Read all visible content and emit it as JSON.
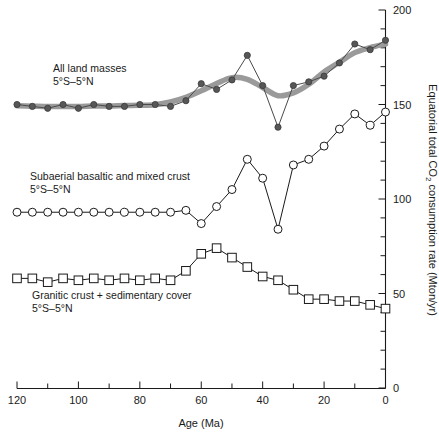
{
  "chart_data": {
    "type": "line",
    "title": "",
    "xlabel": "Age (Ma)",
    "ylabel": "Equatorial total CO2 consumption rate (Mton/yr)",
    "ylabel_parts": {
      "pre": "Equatorial total CO",
      "sub": "2",
      "post": " consumption rate (Mton/yr)"
    },
    "xlim": [
      120,
      0
    ],
    "ylim": [
      0,
      200
    ],
    "x_reversed": true,
    "grid": false,
    "legend_position": "inline-annotations",
    "x_ticks_major": [
      120,
      100,
      80,
      60,
      40,
      20,
      0
    ],
    "x_ticks_minor": [
      110,
      90,
      70,
      50,
      30,
      10
    ],
    "y_ticks_major": [
      0,
      50,
      100,
      150,
      200
    ],
    "y_ticks_minor": [
      10,
      20,
      30,
      40,
      60,
      70,
      80,
      90,
      110,
      120,
      130,
      140,
      160,
      170,
      180,
      190
    ],
    "x_tick_labels": [
      "120",
      "100",
      "80",
      "60",
      "40",
      "20",
      "0"
    ],
    "y_tick_labels": [
      "0",
      "50",
      "100",
      "150",
      "200"
    ],
    "series": [
      {
        "name": "All land masses 5°S–5°N",
        "marker": "filled-circle",
        "color": "#575757",
        "has_smoothed_overlay": true,
        "smoothed_color": "#9a9a9a",
        "x": [
          120,
          115,
          110,
          105,
          100,
          95,
          90,
          85,
          80,
          75,
          70,
          65,
          60,
          55,
          50,
          45,
          40,
          35,
          30,
          25,
          20,
          15,
          10,
          5,
          0
        ],
        "y": [
          150,
          149,
          148,
          150,
          148,
          150,
          149,
          149,
          150,
          150,
          149,
          152,
          161,
          158,
          163,
          176,
          160,
          138,
          160,
          162,
          165,
          172,
          182,
          179,
          184
        ]
      },
      {
        "name": "Subaerial basaltic and mixed crust 5°S–5°N",
        "marker": "open-circle",
        "color": "#1a1a1a",
        "has_smoothed_overlay": false,
        "x": [
          120,
          115,
          110,
          105,
          100,
          95,
          90,
          85,
          80,
          75,
          70,
          65,
          60,
          55,
          50,
          45,
          40,
          35,
          30,
          25,
          20,
          15,
          10,
          5,
          0
        ],
        "y": [
          93,
          93,
          93,
          93,
          93,
          93,
          93,
          93,
          93,
          93,
          93,
          94,
          87,
          96,
          105,
          121,
          111,
          84,
          118,
          121,
          128,
          137,
          145,
          139,
          146
        ]
      },
      {
        "name": "Granitic crust + sedimentary cover 5°S–5°N",
        "marker": "open-square",
        "color": "#1a1a1a",
        "has_smoothed_overlay": false,
        "x": [
          120,
          115,
          110,
          105,
          100,
          95,
          90,
          85,
          80,
          75,
          70,
          65,
          60,
          55,
          50,
          45,
          40,
          35,
          30,
          25,
          20,
          15,
          10,
          5,
          0
        ],
        "y": [
          58,
          58,
          56,
          58,
          57,
          58,
          57,
          58,
          57,
          58,
          57,
          62,
          71,
          74,
          69,
          64,
          59,
          57,
          52,
          47,
          47,
          46,
          46,
          44,
          42
        ]
      }
    ],
    "annotations": [
      {
        "id": "ann-all-land-masses",
        "line1": "All land masses",
        "line2": "5°S–5°N",
        "x_px": 53,
        "y_px": 72
      },
      {
        "id": "ann-subaerial",
        "line1": "Subaerial basaltic and mixed crust",
        "line2": "5°S–5°N",
        "x_px": 30,
        "y_px": 180
      },
      {
        "id": "ann-granitic",
        "line1": "Granitic crust + sedimentary cover",
        "line2": "5°S–5°N",
        "x_px": 32,
        "y_px": 299
      }
    ]
  }
}
